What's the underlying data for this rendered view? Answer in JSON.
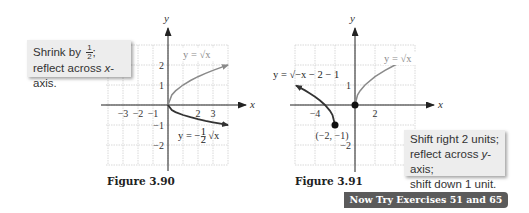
{
  "callouts": {
    "fig1": {
      "line1_prefix": "Shrink by ",
      "fraction_num": "1",
      "fraction_den": "2",
      "line1_suffix": ";",
      "line2_prefix": "reflect across ",
      "line2_var": "x",
      "line2_suffix": "-axis."
    },
    "fig2": {
      "line1": "Shift right 2 units;",
      "line2_prefix": "reflect across ",
      "line2_var": "y",
      "line2_suffix": "-axis;",
      "line3": "shift down 1 unit."
    }
  },
  "captions": {
    "fig1": "Figure 3.90",
    "fig2": "Figure 3.91"
  },
  "banner": {
    "label": "Now Try Exercises 51 and 65",
    "color": "#5b5b5b"
  },
  "colors": {
    "parent_curve": "#8a8a8a",
    "transformed_curve": "#333333",
    "grid": "#cfcfcf",
    "axis": "#222222"
  },
  "chart_data": [
    {
      "type": "line",
      "title": "Figure 3.90",
      "xlabel": "x",
      "ylabel": "y",
      "xlim": [
        -4,
        4
      ],
      "ylim": [
        -3,
        3
      ],
      "grid": true,
      "x_tick_labels": [
        {
          "value": -3,
          "label": "−3"
        },
        {
          "value": -2,
          "label": "−2"
        },
        {
          "value": -1,
          "label": "−1"
        },
        {
          "value": 2,
          "label": "2"
        },
        {
          "value": 3,
          "label": "3"
        }
      ],
      "y_tick_labels": [
        {
          "value": 2,
          "label": "2"
        },
        {
          "value": 1,
          "label": "1"
        },
        {
          "value": -1,
          "label": "−1"
        },
        {
          "value": -2,
          "label": "−2"
        }
      ],
      "series": [
        {
          "name": "y = √x",
          "label_text": "y = √x",
          "role": "parent",
          "x": [
            0,
            0.25,
            0.5,
            1,
            1.5,
            2,
            2.5,
            3,
            3.5,
            4
          ],
          "y": [
            0,
            0.5,
            0.707,
            1,
            1.225,
            1.414,
            1.581,
            1.732,
            1.871,
            2
          ]
        },
        {
          "name": "y = −½√x",
          "label_prefix": "y = −",
          "label_frac_num": "1",
          "label_frac_den": "2",
          "label_suffix": "√x",
          "role": "transformed",
          "x": [
            0,
            0.25,
            0.5,
            1,
            1.5,
            2,
            2.5,
            3,
            3.5,
            4
          ],
          "y": [
            0,
            -0.25,
            -0.354,
            -0.5,
            -0.612,
            -0.707,
            -0.791,
            -0.866,
            -0.935,
            -1
          ]
        }
      ],
      "points": []
    },
    {
      "type": "line",
      "title": "Figure 3.91",
      "xlabel": "x",
      "ylabel": "y",
      "xlim": [
        -6,
        6
      ],
      "ylim": [
        -3,
        3
      ],
      "grid": true,
      "x_tick_labels": [
        {
          "value": -4,
          "label": "−4"
        },
        {
          "value": 2,
          "label": "2"
        }
      ],
      "y_tick_labels": [
        {
          "value": 1,
          "label": "1"
        },
        {
          "value": -2,
          "label": "−2"
        }
      ],
      "series": [
        {
          "name": "y = √x",
          "label_text": "y = √x",
          "role": "parent",
          "x": [
            0,
            0.25,
            0.5,
            1,
            2,
            3,
            4,
            5,
            6
          ],
          "y": [
            0,
            0.5,
            0.707,
            1,
            1.414,
            1.732,
            2,
            2.236,
            2.449
          ]
        },
        {
          "name": "y = √(−x − 2) − 1",
          "label_text": "y = √−x − 2 − 1",
          "role": "transformed",
          "x": [
            -2,
            -2.25,
            -2.5,
            -3,
            -3.5,
            -4,
            -4.5,
            -5,
            -5.9
          ],
          "y": [
            -1,
            -0.5,
            -0.293,
            0,
            0.225,
            0.414,
            0.581,
            0.732,
            0.975
          ]
        }
      ],
      "points": [
        {
          "x": 0,
          "y": 0,
          "label": ""
        },
        {
          "x": -2,
          "y": -1,
          "label": "(−2, −1)"
        }
      ]
    }
  ]
}
